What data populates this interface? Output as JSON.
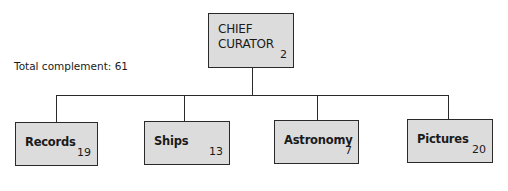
{
  "diagram": {
    "type": "org-chart",
    "total_label": "Total complement: 61",
    "root": {
      "label_line1": "CHIEF",
      "label_line2": "CURATOR",
      "count": "2"
    },
    "departments": [
      {
        "label": "Records",
        "count": "19"
      },
      {
        "label": "Ships",
        "count": "13"
      },
      {
        "label": "Astronomy",
        "count": "7"
      },
      {
        "label": "Pictures",
        "count": "20"
      }
    ],
    "colors": {
      "box_fill": "#dcdcdc",
      "line": "#2a2a2a"
    }
  }
}
